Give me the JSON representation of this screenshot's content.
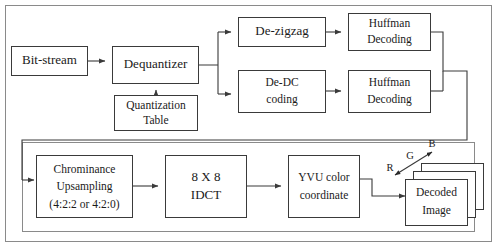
{
  "diagram": {
    "colors": {
      "box_stroke": "#3a3a3a",
      "frame_stroke": "#8a8a8a",
      "text": "#1a1a1a",
      "background": "#ffffff"
    },
    "blocks": {
      "bit_stream": {
        "label": "Bit-stream"
      },
      "dequantizer": {
        "label": "Dequantizer"
      },
      "quantization_table": {
        "line1": "Quantization",
        "line2": "Table"
      },
      "de_zigzag": {
        "label": "De-zigzag"
      },
      "de_dc_coding": {
        "line1": "De-DC",
        "line2": "coding"
      },
      "huffman_decoding_top": {
        "line1": "Huffman",
        "line2": "Decoding"
      },
      "huffman_decoding_bottom": {
        "line1": "Huffman",
        "line2": "Decoding"
      },
      "chrominance_upsampling": {
        "line1": "Chrominance",
        "line2": "Upsampling",
        "line3": "(4:2:2 or 4:2:0)"
      },
      "idct": {
        "line1": "8 X 8",
        "line2": "IDCT"
      },
      "yvu_color_coordinate": {
        "line1": "YVU color",
        "line2": "coordinate"
      },
      "decoded_image": {
        "line1": "Decoded",
        "line2": "Image"
      }
    },
    "annotations": {
      "red_channel": "R",
      "green_channel": "G",
      "blue_channel": "B"
    }
  }
}
